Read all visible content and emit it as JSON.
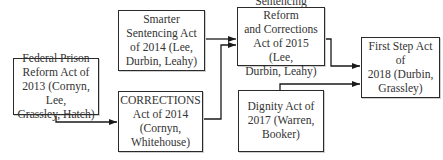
{
  "diagram": {
    "type": "flowchart",
    "title": "",
    "nodes": [
      {
        "id": "n1",
        "label": "Federal Prison\nReform Act of\n2013 (Cornyn, Lee,\nGrassley, Hatch)"
      },
      {
        "id": "n2",
        "label": "Smarter\nSentencing Act\nof 2014 (Lee,\nDurbin, Leahy)"
      },
      {
        "id": "n3",
        "label": "CORRECTIONS\nAct of 2014\n(Cornyn,\nWhitehouse)"
      },
      {
        "id": "n4",
        "label": "Sentencing Reform\nand Corrections\nAct of 2015 (Lee,\nDurbin, Leahy)"
      },
      {
        "id": "n5",
        "label": "Dignity Act of\n2017 (Warren,\nBooker)"
      },
      {
        "id": "n6",
        "label": "First Step Act of\n2018 (Durbin,\nGrassley)"
      }
    ],
    "edges": [
      {
        "from": "n1",
        "to": "n3"
      },
      {
        "from": "n2",
        "to": "n4"
      },
      {
        "from": "n3",
        "to": "n4"
      },
      {
        "from": "n4",
        "to": "n6"
      },
      {
        "from": "n5",
        "to": "n6"
      }
    ],
    "colors": {
      "stroke": "#2a2a2a",
      "text": "#333333",
      "background": "#ffffff"
    }
  }
}
